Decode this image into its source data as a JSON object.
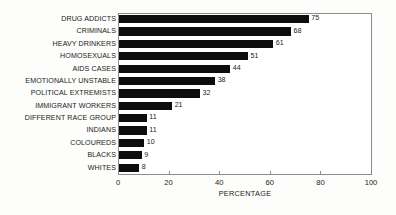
{
  "chart_data": {
    "type": "bar",
    "orientation": "horizontal",
    "title": "",
    "xlabel": "PERCENTAGE",
    "ylabel": "",
    "xlim": [
      0,
      100
    ],
    "xticks": [
      0,
      20,
      40,
      60,
      80,
      100
    ],
    "grid": false,
    "legend": null,
    "bar_color": "#0d0d0d",
    "frame_color": "#8c8c8c",
    "show_value_labels": true,
    "categories": [
      "DRUG ADDICTS",
      "CRIMINALS",
      "HEAVY DRINKERS",
      "HOMOSEXUALS",
      "AIDS CASES",
      "EMOTIONALLY UNSTABLE",
      "POLITICAL EXTREMISTS",
      "IMMIGRANT WORKERS",
      "DIFFERENT RACE GROUP",
      "INDIANS",
      "COLOUREDS",
      "BLACKS",
      "WHITES"
    ],
    "values": [
      75,
      68,
      61,
      51,
      44,
      38,
      32,
      21,
      11,
      11,
      10,
      9,
      8
    ],
    "value_labels": [
      "75",
      "68",
      "61",
      "51",
      "44",
      "38",
      "32",
      "21",
      "11",
      "11",
      "10",
      "9",
      "8"
    ],
    "tick_labels": [
      "0",
      "20",
      "40",
      "60",
      "80",
      "100"
    ]
  }
}
